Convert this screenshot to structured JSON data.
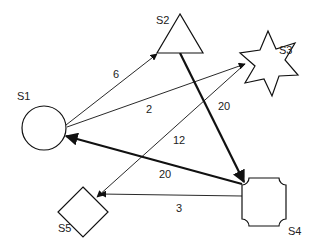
{
  "diagram": {
    "type": "directed-weighted-graph",
    "nodes": [
      {
        "id": "S1",
        "label": "S1",
        "shape": "circle"
      },
      {
        "id": "S2",
        "label": "S2",
        "shape": "triangle"
      },
      {
        "id": "S3",
        "label": "S3",
        "shape": "star"
      },
      {
        "id": "S4",
        "label": "S4",
        "shape": "concave-corner-square"
      },
      {
        "id": "S5",
        "label": "S5",
        "shape": "diamond"
      }
    ],
    "edges": [
      {
        "from": "S1",
        "to": "S2",
        "weight": "6",
        "style": "thin"
      },
      {
        "from": "S1",
        "to": "S3",
        "weight": "2",
        "style": "thin"
      },
      {
        "from": "S3",
        "to": "S5",
        "weight": "12",
        "style": "thin"
      },
      {
        "from": "S2",
        "to": "S4",
        "weight": "20",
        "style": "thick"
      },
      {
        "from": "S4",
        "to": "S1",
        "weight": "20",
        "style": "thick"
      },
      {
        "from": "S4",
        "to": "S5",
        "weight": "3",
        "style": "thin"
      }
    ],
    "colors": {
      "stroke": "#111111",
      "background": "#ffffff"
    }
  }
}
